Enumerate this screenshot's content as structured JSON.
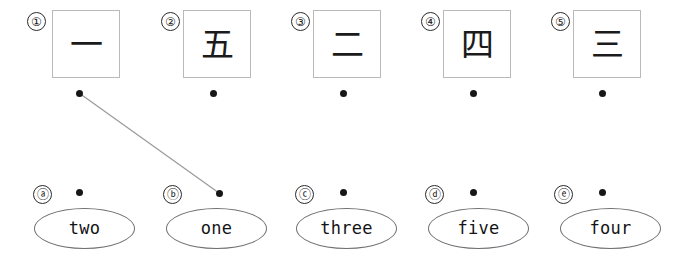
{
  "exercise": {
    "type": "matching",
    "title": "Kanji numeral to English word matching",
    "colors": {
      "card_border": "#b9b9bc",
      "oval_border": "#6f6f74",
      "dot": "#17171a",
      "line": "#9a9a9e",
      "ink": "#1b1b1b",
      "background": "#ffffff"
    },
    "prompts": [
      {
        "marker": "①",
        "marker_plain": "1",
        "glyph": "一",
        "meaning": "one",
        "marker_pos": {
          "x": 27,
          "y": 12
        },
        "card_pos": {
          "x": 52,
          "y": 10
        },
        "dot_pos": {
          "x": 79,
          "y": 93
        }
      },
      {
        "marker": "②",
        "marker_plain": "2",
        "glyph": "五",
        "meaning": "five",
        "marker_pos": {
          "x": 161,
          "y": 12
        },
        "card_pos": {
          "x": 183,
          "y": 10
        },
        "dot_pos": {
          "x": 213,
          "y": 93
        }
      },
      {
        "marker": "③",
        "marker_plain": "3",
        "glyph": "二",
        "meaning": "two",
        "marker_pos": {
          "x": 291,
          "y": 12
        },
        "card_pos": {
          "x": 313,
          "y": 10
        },
        "dot_pos": {
          "x": 343,
          "y": 93
        }
      },
      {
        "marker": "④",
        "marker_plain": "4",
        "glyph": "四",
        "meaning": "four",
        "marker_pos": {
          "x": 421,
          "y": 12
        },
        "card_pos": {
          "x": 443,
          "y": 10
        },
        "dot_pos": {
          "x": 473,
          "y": 93
        }
      },
      {
        "marker": "⑤",
        "marker_plain": "5",
        "glyph": "三",
        "meaning": "three",
        "marker_pos": {
          "x": 551,
          "y": 12
        },
        "card_pos": {
          "x": 573,
          "y": 10
        },
        "dot_pos": {
          "x": 602,
          "y": 93
        }
      }
    ],
    "answers": [
      {
        "marker": "ⓐ",
        "marker_plain": "a",
        "label": "two",
        "marker_pos": {
          "x": 33,
          "y": 185
        },
        "oval_pos": {
          "x": 34,
          "y": 208
        },
        "dot_pos": {
          "x": 79,
          "y": 192
        }
      },
      {
        "marker": "ⓑ",
        "marker_plain": "b",
        "label": "one",
        "marker_pos": {
          "x": 163,
          "y": 185
        },
        "oval_pos": {
          "x": 166,
          "y": 208
        },
        "dot_pos": {
          "x": 219,
          "y": 193
        }
      },
      {
        "marker": "ⓒ",
        "marker_plain": "c",
        "label": "three",
        "marker_pos": {
          "x": 295,
          "y": 185
        },
        "oval_pos": {
          "x": 296,
          "y": 208
        },
        "dot_pos": {
          "x": 343,
          "y": 192
        }
      },
      {
        "marker": "ⓓ",
        "marker_plain": "d",
        "label": "five",
        "marker_pos": {
          "x": 425,
          "y": 185
        },
        "oval_pos": {
          "x": 428,
          "y": 208
        },
        "dot_pos": {
          "x": 473,
          "y": 192
        }
      },
      {
        "marker": "ⓔ",
        "marker_plain": "e",
        "label": "four",
        "marker_pos": {
          "x": 554,
          "y": 185
        },
        "oval_pos": {
          "x": 560,
          "y": 208
        },
        "dot_pos": {
          "x": 602,
          "y": 192
        }
      }
    ],
    "connections": [
      {
        "from_marker": "①",
        "to_marker": "ⓑ",
        "x1": 79,
        "y1": 93,
        "x2": 219,
        "y2": 193
      }
    ]
  }
}
